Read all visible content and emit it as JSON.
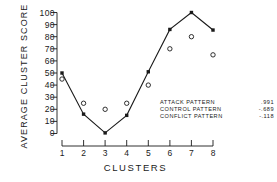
{
  "chart_data": {
    "type": "scatter",
    "title": "",
    "xlabel": "CLUSTERS",
    "ylabel": "AVERAGE CLUSTER SCORE",
    "categories": [
      "1",
      "2",
      "3",
      "4",
      "5",
      "6",
      "7",
      "8"
    ],
    "xticklabels": [
      "1",
      "2",
      "3",
      "4",
      "5",
      "6",
      "7",
      "8"
    ],
    "yticklabels": [
      "100",
      "90",
      "80",
      "70",
      "60",
      "50",
      "40",
      "30",
      "20",
      "10",
      "0"
    ],
    "ylim": [
      0,
      100
    ],
    "xlim": [
      0.5,
      8.5
    ],
    "grid": false,
    "legend_position": "inside-lower-right",
    "series": [
      {
        "name": "attack-pattern-line",
        "marker": "filled-square",
        "line": true,
        "values": [
          50,
          16,
          0.5,
          15,
          51,
          86,
          100,
          85.5
        ]
      },
      {
        "name": "control-pattern-points",
        "marker": "open-circle",
        "line": false,
        "values": [
          45,
          25,
          20,
          25,
          40,
          70,
          80,
          65
        ]
      }
    ],
    "annotations": [
      {
        "label": "ATTACK PATTERN",
        "value": ".991"
      },
      {
        "label": "CONTROL PATTERN",
        "value": "-.689"
      },
      {
        "label": "CONFLICT PATTERN",
        "value": "-.118"
      }
    ]
  },
  "colors": {
    "ink": "#1a1a1a",
    "background": "#ffffff"
  }
}
